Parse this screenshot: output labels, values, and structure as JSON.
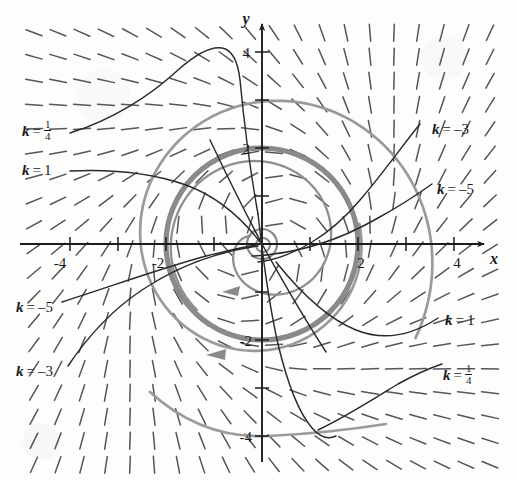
{
  "figure": {
    "type": "direction-field",
    "axis": {
      "x_label": "x",
      "y_label": "y",
      "x_ticks": [
        "-4",
        "-2",
        "2",
        "4"
      ],
      "y_ticks": [
        "4",
        "2",
        "-2",
        "-4"
      ],
      "x_tick_values": [
        -4,
        -2,
        2,
        4
      ],
      "y_tick_values": [
        4,
        2,
        -2,
        -4
      ],
      "xlim": [
        -4.9,
        5.1
      ],
      "ylim": [
        -4.9,
        4.6
      ],
      "origin_px": [
        262,
        244
      ],
      "scale_px_per_unit": 48
    },
    "curve_labels": [
      {
        "id": "left-quarter",
        "k": "1/4",
        "prefix": "k",
        "eq": "=",
        "num": "1",
        "den": "4",
        "x": 22,
        "y": 120
      },
      {
        "id": "left-one",
        "k": "1",
        "prefix": "k",
        "eq": "=",
        "value": "1",
        "x": 22,
        "y": 163
      },
      {
        "id": "right-neg3",
        "k": "-3",
        "prefix": "k",
        "eq": "=",
        "value": "–3",
        "x": 432,
        "y": 122
      },
      {
        "id": "right-neg5",
        "k": "-5",
        "prefix": "k",
        "eq": "=",
        "value": "–5",
        "x": 437,
        "y": 182
      },
      {
        "id": "left-neg5",
        "k": "-5",
        "prefix": "k",
        "eq": "=",
        "value": "–5",
        "x": 16,
        "y": 300
      },
      {
        "id": "left-neg3",
        "k": "-3",
        "prefix": "k",
        "eq": "=",
        "value": "–3",
        "x": 16,
        "y": 364
      },
      {
        "id": "right-one",
        "k": "1",
        "prefix": "k",
        "eq": "=",
        "value": "1",
        "x": 445,
        "y": 313
      },
      {
        "id": "right-quarter",
        "k": "1/4",
        "prefix": "k",
        "eq": "=",
        "num": "1",
        "den": "4",
        "x": 443,
        "y": 364
      }
    ],
    "colors": {
      "axis": "#1c1c1c",
      "slope_field": "#55555a",
      "solution_curve": "#2a2a2a",
      "cycle_gray": "#8a8a8a",
      "spiral_gray": "#9a9a9a",
      "text": "#1c1c1c",
      "background": "#fdfdfc"
    },
    "elements": {
      "limit_cycle_radius": 2,
      "inner_spiral_note": "outward spiral from origin to r=2",
      "outer_spiral_note": "inward spiral from r~3.5 to r=2",
      "arrow_direction": "counterclockwise"
    },
    "ghost_text": " "
  },
  "chart_data": {
    "type": "line",
    "title": "",
    "xlabel": "x",
    "ylabel": "y",
    "xlim": [
      -4.9,
      5.1
    ],
    "ylim": [
      -4.9,
      4.6
    ],
    "xticks": [
      -4,
      -2,
      2,
      4
    ],
    "yticks": [
      -4,
      -2,
      2,
      4
    ],
    "grid": false,
    "legend": "inline-curve-labels",
    "annotations": [
      "k = 1/4",
      "k = 1",
      "k = -3",
      "k = -5",
      "k = -5",
      "k = -3",
      "k = 1",
      "k = 1/4"
    ],
    "series": [
      {
        "name": "limit cycle r = 2",
        "kind": "circle",
        "radius": 2,
        "color": "#8a8a8a",
        "width": 5
      },
      {
        "name": "inner spiral (outward)",
        "kind": "spiral",
        "r_start": 0.28,
        "r_end": 1.95,
        "color": "#8f8f8f",
        "width": 2.2
      },
      {
        "name": "outer spiral (inward)",
        "kind": "spiral",
        "r_start": 3.6,
        "r_end": 2.1,
        "color": "#9a9a9a",
        "width": 2.6
      },
      {
        "name": "k = 1/4 (upper left)",
        "kind": "solution",
        "color": "#2a2a2a"
      },
      {
        "name": "k = 1 (left)",
        "kind": "solution",
        "color": "#2a2a2a"
      },
      {
        "name": "k = -3 (right)",
        "kind": "solution",
        "color": "#2a2a2a"
      },
      {
        "name": "k = -5 (right)",
        "kind": "solution",
        "color": "#2a2a2a"
      },
      {
        "name": "k = -5 (lower left)",
        "kind": "solution",
        "color": "#2a2a2a"
      },
      {
        "name": "k = -3 (lower left)",
        "kind": "solution",
        "color": "#2a2a2a"
      },
      {
        "name": "k = 1 (lower right)",
        "kind": "solution",
        "color": "#2a2a2a"
      },
      {
        "name": "k = 1/4 (lower right)",
        "kind": "solution",
        "color": "#2a2a2a"
      }
    ],
    "slope_field": {
      "description": "short dashes, grid spacing 0.5 units, angle rotates with polar angle (rotational/spiral field)",
      "spacing_units": 0.5,
      "dash_length_px": 17
    }
  }
}
